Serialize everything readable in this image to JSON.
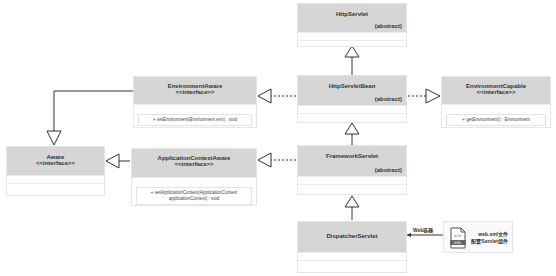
{
  "diagram": {
    "type": "UML class diagram",
    "classes": {
      "httpservlet": {
        "name": "HttpServlet",
        "modifier": "(abstract)"
      },
      "httpservletbean": {
        "name": "HttpServletBean",
        "modifier": "(abstract)"
      },
      "frameworkservlet": {
        "name": "FrameworkServlet",
        "modifier": "(abstract)"
      },
      "dispatcherservlet": {
        "name": "DispatcherServlet"
      },
      "environmentaware": {
        "name": "EnvironmentAware",
        "stereotype": "<<interface>>",
        "method": "+ setEnvironment(Environment env) : void"
      },
      "environmentcapable": {
        "name": "EnvironmentCapable",
        "stereotype": "<<interface>>",
        "method": "+ getEnvironment() : Environment"
      },
      "applicationcontextaware": {
        "name": "ApplicationContextAware",
        "stereotype": "<<interface>>",
        "method_line1": "+ setApplicationContext(ApplicationContext",
        "method_line2": "applicationContext) : void"
      },
      "aware": {
        "name": "Aware",
        "stereotype": "<<interface>>"
      }
    },
    "relations": [
      {
        "from": "HttpServletBean",
        "to": "HttpServlet",
        "kind": "generalization"
      },
      {
        "from": "FrameworkServlet",
        "to": "HttpServletBean",
        "kind": "generalization"
      },
      {
        "from": "DispatcherServlet",
        "to": "FrameworkServlet",
        "kind": "generalization"
      },
      {
        "from": "HttpServletBean",
        "to": "EnvironmentAware",
        "kind": "realization"
      },
      {
        "from": "HttpServletBean",
        "to": "EnvironmentCapable",
        "kind": "realization"
      },
      {
        "from": "FrameworkServlet",
        "to": "ApplicationContextAware",
        "kind": "realization"
      },
      {
        "from": "EnvironmentAware",
        "to": "Aware",
        "kind": "generalization"
      },
      {
        "from": "ApplicationContextAware",
        "to": "Aware",
        "kind": "generalization"
      }
    ],
    "note": {
      "arrow_label": "Web容器",
      "line1": "web.xml文件",
      "line2": "配置Servlet组件",
      "icon": "xml-file-icon"
    },
    "colors": {
      "header": "#d6d6d6",
      "border": "#e6e6e6",
      "line": "#333333"
    }
  }
}
